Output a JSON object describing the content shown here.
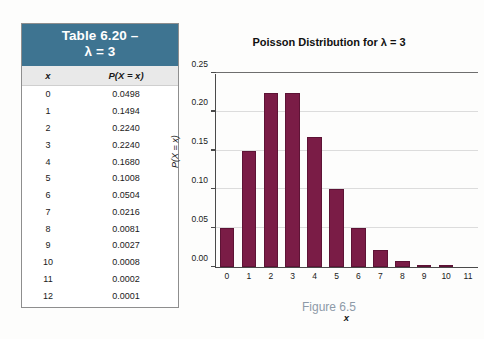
{
  "table": {
    "title_line1": "Table 6.20 –",
    "title_line2": "λ = 3",
    "columns": [
      "x",
      "P(X = x)"
    ],
    "rows": [
      [
        "0",
        "0.0498"
      ],
      [
        "1",
        "0.1494"
      ],
      [
        "2",
        "0.2240"
      ],
      [
        "3",
        "0.2240"
      ],
      [
        "4",
        "0.1680"
      ],
      [
        "5",
        "0.1008"
      ],
      [
        "6",
        "0.0504"
      ],
      [
        "7",
        "0.0216"
      ],
      [
        "8",
        "0.0081"
      ],
      [
        "9",
        "0.0027"
      ],
      [
        "10",
        "0.0008"
      ],
      [
        "11",
        "0.0002"
      ],
      [
        "12",
        "0.0001"
      ]
    ],
    "header_color": "#3e7491",
    "column_header_color": "#e9e9e9"
  },
  "figure": {
    "caption": "Figure 6.5",
    "caption_color": "#8d9aa8"
  },
  "chart_data": {
    "type": "bar",
    "title": "Poisson Distribution for λ = 3",
    "xlabel": "x",
    "ylabel": "P(X = x)",
    "categories": [
      "0",
      "1",
      "2",
      "3",
      "4",
      "5",
      "6",
      "7",
      "8",
      "9",
      "10",
      "11"
    ],
    "values": [
      0.0498,
      0.1494,
      0.224,
      0.224,
      0.168,
      0.1008,
      0.0504,
      0.0216,
      0.0081,
      0.0027,
      0.0008,
      0.0002
    ],
    "ylim": [
      0.0,
      0.25
    ],
    "ytick_labels": [
      "0.00",
      "0.05",
      "0.10",
      "0.15",
      "0.20",
      "0.25"
    ],
    "ytick_values": [
      0.0,
      0.05,
      0.1,
      0.15,
      0.2,
      0.25
    ],
    "xtick_labels": [
      "0",
      "1",
      "2",
      "3",
      "4",
      "5",
      "6",
      "7",
      "8",
      "9",
      "10",
      "11"
    ],
    "grid": true,
    "legend": "none",
    "bar_color": "#7a1c46"
  }
}
